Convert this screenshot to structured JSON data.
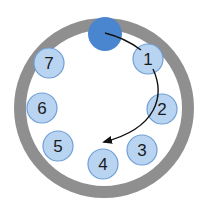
{
  "diagram": {
    "ring": {
      "cx": 104,
      "cy": 108,
      "r": 84,
      "stroke_width": 12,
      "color": "#8f8f8f"
    },
    "active_dot": {
      "cx": 105,
      "cy": 34,
      "r": 17,
      "color": "#4a86cf"
    },
    "slot_color": "#b9d4f1",
    "slot_stroke": "#6f9fd6",
    "slots": [
      {
        "label": "1",
        "cx": 148,
        "cy": 59
      },
      {
        "label": "2",
        "cx": 162,
        "cy": 109
      },
      {
        "label": "3",
        "cx": 142,
        "cy": 150
      },
      {
        "label": "4",
        "cx": 103,
        "cy": 164
      },
      {
        "label": "5",
        "cx": 58,
        "cy": 146
      },
      {
        "label": "6",
        "cx": 42,
        "cy": 108
      },
      {
        "label": "7",
        "cx": 49,
        "cy": 63
      }
    ],
    "arrow_color": "#111111"
  }
}
